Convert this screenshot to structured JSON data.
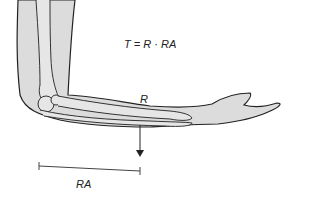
{
  "diagram": {
    "formula": "T = R · RA",
    "labels": {
      "force": "R",
      "moment_arm": "RA"
    },
    "colors": {
      "limb_fill": "#dcdcdc",
      "outline": "#222222",
      "background": "#ffffff"
    },
    "elements": [
      "upper-arm",
      "forearm",
      "hand",
      "humerus-bone",
      "radius-ulna-bones",
      "elbow-joint",
      "downward-force-arrow",
      "moment-arm-bracket"
    ]
  }
}
